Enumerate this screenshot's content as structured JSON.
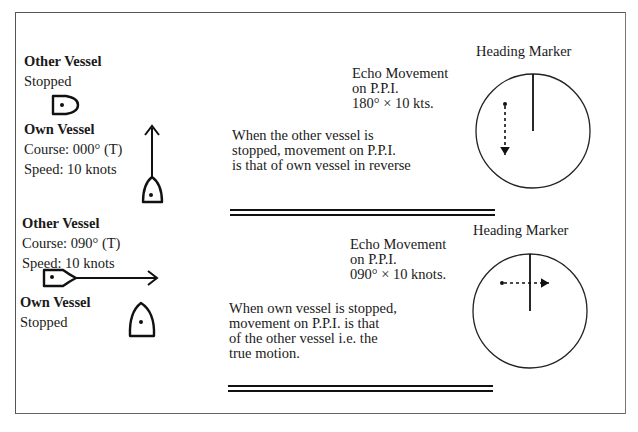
{
  "panel_1": {
    "other_vessel": {
      "title": "Other Vessel",
      "status": "Stopped"
    },
    "own_vessel": {
      "title": "Own Vessel",
      "course": "Course: 000° (T)",
      "speed": "Speed: 10 knots"
    },
    "echo": {
      "line1": "Echo Movement",
      "line2": "on P.P.I.",
      "line3": "180° × 10 kts."
    },
    "explanation": {
      "line1": "When the other vessel is",
      "line2": "stopped, movement on P.P.I.",
      "line3": "is that of own vessel in reverse"
    },
    "ppi": {
      "label": "Heading Marker",
      "echo_direction": "down"
    }
  },
  "panel_2": {
    "other_vessel": {
      "title": "Other Vessel",
      "course": "Course: 090° (T)",
      "speed": "Speed: 10 knots"
    },
    "own_vessel": {
      "title": "Own Vessel",
      "status": "Stopped"
    },
    "echo": {
      "line1": "Echo Movement",
      "line2": "on P.P.I.",
      "line3": "090° × 10 knots."
    },
    "explanation": {
      "line1": "When own vessel is stopped,",
      "line2": "movement on P.P.I. is that",
      "line3": "of the other vessel i.e. the",
      "line4": "true motion."
    },
    "ppi": {
      "label": "Heading Marker",
      "echo_direction": "right"
    }
  },
  "colors": {
    "ink": "#1a1a1a",
    "frame": "#555555",
    "background": "#ffffff"
  }
}
